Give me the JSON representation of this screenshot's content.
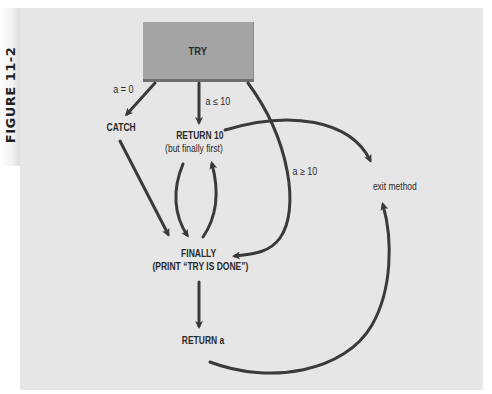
{
  "figure": {
    "label": "FIGURE 11-2"
  },
  "nodes": {
    "try": "TRY",
    "catch": "CATCH",
    "return10_line1": "RETURN 10",
    "return10_line2": "(but finally first)",
    "finally_line1": "FINALLY",
    "finally_line2": "(PRINT “TRY IS DONE”)",
    "return_a": "RETURN a",
    "exit_method": "exit method"
  },
  "edges": {
    "try_to_catch": "a = 0",
    "try_to_return10": "a ≤ 10",
    "try_to_finally": "a ≥ 10"
  },
  "colors": {
    "panel": "#e6e6e6",
    "try_box": "#a4a4a4",
    "arrow": "#3a3a3a",
    "text": "#2a2a2a"
  }
}
